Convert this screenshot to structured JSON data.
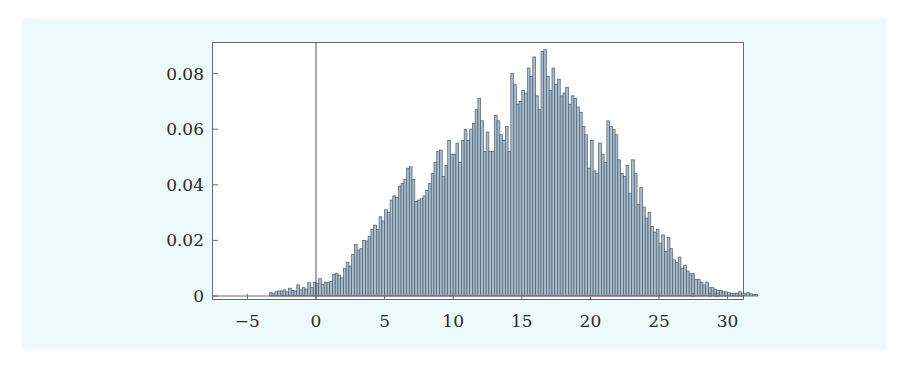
{
  "chart_data": {
    "type": "bar",
    "subtype": "histogram",
    "title": "",
    "xlabel": "",
    "ylabel": "",
    "xlim": [
      -7.1,
      31.6
    ],
    "ylim": [
      -0.0015,
      0.091
    ],
    "x_ticks": [
      -5,
      0,
      5,
      10,
      15,
      20,
      25,
      30
    ],
    "x_tick_labels": [
      "−5",
      "0",
      "5",
      "10",
      "15",
      "20",
      "25",
      "30"
    ],
    "y_ticks": [
      0,
      0.02,
      0.04,
      0.06,
      0.08
    ],
    "y_tick_labels": [
      "0",
      "0.02",
      "0.04",
      "0.06",
      "0.08"
    ],
    "grid": false,
    "legend": null,
    "vertical_reference_line_x": 0,
    "bin_width": 0.2,
    "bin_start": -3.4,
    "values": [
      0.0012,
      0.0008,
      0.0015,
      0.0018,
      0.0018,
      0.0022,
      0.0015,
      0.0028,
      0.002,
      0.0018,
      0.004,
      0.0022,
      0.003,
      0.0025,
      0.0048,
      0.003,
      0.005,
      0.0045,
      0.0062,
      0.0042,
      0.005,
      0.0048,
      0.0052,
      0.0078,
      0.0082,
      0.0075,
      0.0065,
      0.01,
      0.0122,
      0.0108,
      0.015,
      0.0185,
      0.0165,
      0.017,
      0.02,
      0.0198,
      0.0215,
      0.024,
      0.0255,
      0.024,
      0.0285,
      0.027,
      0.031,
      0.03,
      0.0345,
      0.036,
      0.0355,
      0.0395,
      0.0405,
      0.042,
      0.046,
      0.0465,
      0.042,
      0.034,
      0.0345,
      0.035,
      0.036,
      0.038,
      0.0405,
      0.044,
      0.048,
      0.052,
      0.0525,
      0.043,
      0.047,
      0.056,
      0.051,
      0.051,
      0.055,
      0.048,
      0.056,
      0.06,
      0.056,
      0.06,
      0.062,
      0.067,
      0.071,
      0.063,
      0.052,
      0.059,
      0.052,
      0.052,
      0.065,
      0.063,
      0.058,
      0.056,
      0.061,
      0.052,
      0.08,
      0.076,
      0.069,
      0.07,
      0.074,
      0.073,
      0.082,
      0.079,
      0.086,
      0.072,
      0.067,
      0.088,
      0.0886,
      0.079,
      0.074,
      0.082,
      0.076,
      0.078,
      0.072,
      0.073,
      0.075,
      0.069,
      0.072,
      0.071,
      0.068,
      0.066,
      0.061,
      0.058,
      0.046,
      0.056,
      0.045,
      0.044,
      0.055,
      0.051,
      0.048,
      0.063,
      0.061,
      0.06,
      0.058,
      0.049,
      0.044,
      0.043,
      0.047,
      0.037,
      0.049,
      0.044,
      0.033,
      0.039,
      0.032,
      0.028,
      0.03,
      0.025,
      0.023,
      0.024,
      0.019,
      0.022,
      0.016,
      0.021,
      0.017,
      0.013,
      0.012,
      0.014,
      0.01,
      0.011,
      0.009,
      0.008,
      0.008,
      0.006,
      0.006,
      0.005,
      0.004,
      0.005,
      0.003,
      0.003,
      0.0025,
      0.002,
      0.002,
      0.0015,
      0.0015,
      0.0012,
      0.001,
      0.001,
      0.001,
      0.0015,
      0.001,
      0.0008,
      0.0012,
      0.0008,
      0.0005,
      0.0005,
      0.0,
      0.0,
      0.0,
      0.0,
      0.0,
      0.0,
      0.0,
      0.0,
      0.0,
      0.0,
      0.0,
      0.0,
      0.0,
      0.0,
      0.0,
      0.0,
      0.0,
      0.0,
      0.0,
      0.0,
      0.0,
      0.0,
      0.0,
      0.0,
      0.0,
      0.0,
      0.0,
      0.0,
      0.0,
      0.0,
      0.0,
      0.0,
      0.0,
      0.0,
      0.0,
      0.0,
      0.0,
      0.0,
      0.0,
      0.0,
      0.0,
      0.0,
      0.0,
      0.0,
      0.0,
      0.0,
      0.0,
      0.0,
      0.0,
      0.0,
      0.0,
      0.0,
      0.0,
      0.0,
      0.0,
      0.0,
      0.0,
      0.0,
      0.0,
      0.0,
      0.0,
      0.0
    ],
    "sparse_tail": [
      {
        "x": 27.4,
        "value": 0.0008
      },
      {
        "x": 28.6,
        "value": 0.0008
      },
      {
        "x": 29.0,
        "value": 0.0008
      },
      {
        "x": 29.2,
        "value": 0.0008
      }
    ],
    "colors": {
      "bar_fill": "#a9bccc",
      "bar_edge": "#4e5f70",
      "frame": "#6a6a6a",
      "background_panel": "#ecfafc",
      "plot_area": "#ffffff"
    }
  }
}
